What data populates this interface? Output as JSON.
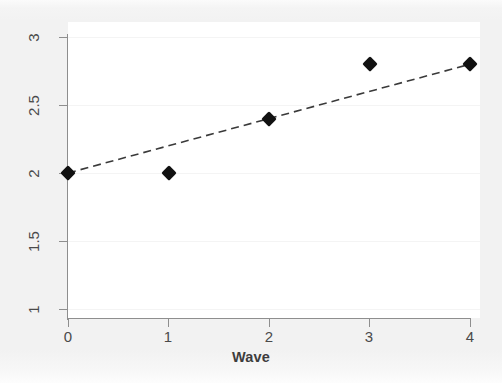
{
  "chart_data": {
    "type": "scatter",
    "title": "",
    "subtitle": "",
    "xlabel": "Wave",
    "ylabel": "",
    "x": [
      0,
      1,
      2,
      3,
      4
    ],
    "values": [
      2.0,
      2.0,
      2.4,
      2.8,
      2.8
    ],
    "series": [
      {
        "name": "Observed",
        "marker": "filled-diamond",
        "color": "#111111",
        "x": [
          0,
          1,
          2,
          3,
          4
        ],
        "values": [
          2.0,
          2.0,
          2.4,
          2.8,
          2.8
        ]
      },
      {
        "name": "Fitted line",
        "style": "dashed",
        "color": "#3a3a3a",
        "x": [
          0,
          4
        ],
        "values": [
          2.0,
          2.8
        ]
      }
    ],
    "xlim": [
      0,
      4
    ],
    "ylim": [
      1,
      3
    ],
    "xticks": [
      0,
      1,
      2,
      3,
      4
    ],
    "yticks": [
      1,
      1.5,
      2,
      2.5,
      3
    ],
    "xtick_labels": [
      "0",
      "1",
      "2",
      "3",
      "4"
    ],
    "ytick_labels": [
      "1",
      "1.5",
      "2",
      "2.5",
      "3"
    ],
    "grid": "horizontal-faint",
    "legend": "none",
    "annotations": []
  },
  "axes": {
    "y_labels": [
      {
        "text": "3",
        "value": 3
      },
      {
        "text": "2.5",
        "value": 2.5
      },
      {
        "text": "2",
        "value": 2
      },
      {
        "text": "1.5",
        "value": 1.5
      },
      {
        "text": "1",
        "value": 1
      }
    ],
    "x_labels": [
      {
        "text": "0",
        "value": 0
      },
      {
        "text": "1",
        "value": 1
      },
      {
        "text": "2",
        "value": 2
      },
      {
        "text": "3",
        "value": 3
      },
      {
        "text": "4",
        "value": 4
      }
    ],
    "x_title": "Wave"
  },
  "colors": {
    "figure_background": "#f2f2f2",
    "plot_background": "#ffffff",
    "axis": "#8e8e8e",
    "gridline": "#f4f4f4",
    "marker": "#111111",
    "fitline": "#3a3a3a",
    "tick_label": "#4a4a4a",
    "axis_title": "#3d3d3d"
  }
}
